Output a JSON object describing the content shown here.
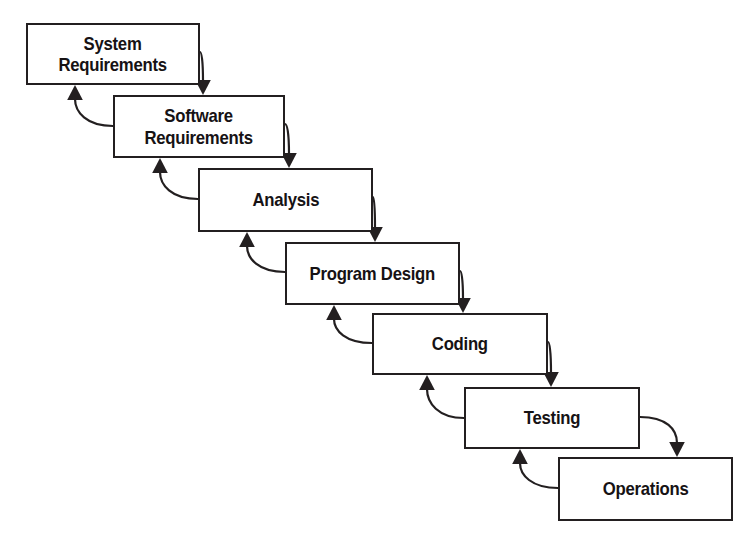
{
  "diagram": {
    "type": "flowchart",
    "background_color": "#ffffff",
    "line_color": "#231f20",
    "box_fill_color": "#ffffff",
    "text_color": "#161214",
    "phases": [
      {
        "id": "system-requirements",
        "label": "System\nRequirements",
        "x": 26,
        "y": 23,
        "width": 174,
        "height": 62
      },
      {
        "id": "software-requirements",
        "label": "Software\nRequirements",
        "x": 113,
        "y": 95,
        "width": 172,
        "height": 63
      },
      {
        "id": "analysis",
        "label": "Analysis",
        "x": 198,
        "y": 168,
        "width": 175,
        "height": 64
      },
      {
        "id": "program-design",
        "label": "Program Design",
        "x": 285,
        "y": 242,
        "width": 175,
        "height": 63
      },
      {
        "id": "coding",
        "label": "Coding",
        "x": 372,
        "y": 313,
        "width": 176,
        "height": 62
      },
      {
        "id": "testing",
        "label": "Testing",
        "x": 464,
        "y": 387,
        "width": 176,
        "height": 62
      },
      {
        "id": "operations",
        "label": "Operations",
        "x": 558,
        "y": 457,
        "width": 175,
        "height": 64
      }
    ],
    "forward_arrows": [
      {
        "from": "system-requirements",
        "to": "software-requirements",
        "start_x": 200,
        "start_y": 52,
        "end_x": 203,
        "end_y": 95
      },
      {
        "from": "software-requirements",
        "to": "analysis",
        "start_x": 285,
        "start_y": 124,
        "end_x": 289,
        "end_y": 168
      },
      {
        "from": "analysis",
        "to": "program-design",
        "start_x": 373,
        "start_y": 197,
        "end_x": 375,
        "end_y": 242
      },
      {
        "from": "program-design",
        "to": "coding",
        "start_x": 460,
        "start_y": 271,
        "end_x": 463,
        "end_y": 313
      },
      {
        "from": "coding",
        "to": "testing",
        "start_x": 548,
        "start_y": 342,
        "end_x": 551,
        "end_y": 387
      },
      {
        "from": "testing",
        "to": "operations",
        "start_x": 640,
        "start_y": 417,
        "end_x": 677,
        "end_y": 457
      }
    ],
    "feedback_arrows": [
      {
        "from": "software-requirements",
        "to": "system-requirements",
        "start_x": 113,
        "start_y": 126,
        "end_x": 75,
        "end_y": 85
      },
      {
        "from": "analysis",
        "to": "software-requirements",
        "start_x": 198,
        "start_y": 199,
        "end_x": 160,
        "end_y": 158
      },
      {
        "from": "program-design",
        "to": "analysis",
        "start_x": 285,
        "start_y": 272,
        "end_x": 247,
        "end_y": 232
      },
      {
        "from": "coding",
        "to": "program-design",
        "start_x": 372,
        "start_y": 343,
        "end_x": 334,
        "end_y": 305
      },
      {
        "from": "testing",
        "to": "coding",
        "start_x": 464,
        "start_y": 418,
        "end_x": 427,
        "end_y": 375
      },
      {
        "from": "operations",
        "to": "testing",
        "start_x": 558,
        "start_y": 488,
        "end_x": 520,
        "end_y": 449
      }
    ]
  }
}
